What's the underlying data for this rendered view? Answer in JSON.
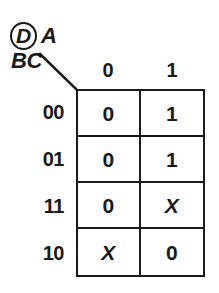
{
  "diagram": {
    "type": "karnaugh-map",
    "column_variable_label": "A",
    "column_variable_circled": "D",
    "row_variable_label": "BC",
    "column_headers": [
      "0",
      "1"
    ],
    "row_headers": [
      "00",
      "01",
      "11",
      "10"
    ],
    "cells": [
      [
        "0",
        "1"
      ],
      [
        "0",
        "1"
      ],
      [
        "0",
        "X"
      ],
      [
        "X",
        "0"
      ]
    ],
    "colors": {
      "ink": "#1a1a1a",
      "background": "#ffffff"
    }
  }
}
